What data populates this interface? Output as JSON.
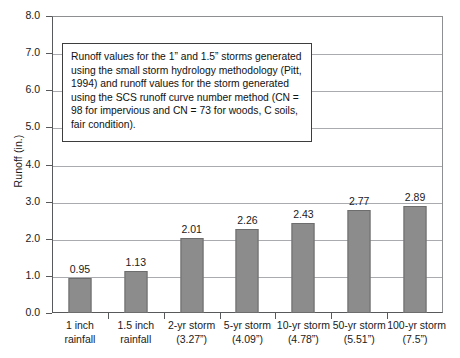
{
  "chart_data": {
    "type": "bar",
    "title": "",
    "xlabel": "",
    "ylabel": "Runoff (in.)",
    "ylim": [
      0.0,
      8.0
    ],
    "y_ticks": [
      "0.0",
      "1.0",
      "2.0",
      "3.0",
      "4.0",
      "5.0",
      "6.0",
      "7.0",
      "8.0"
    ],
    "grid": true,
    "legend": "none",
    "categories": [
      "1 inch rainfall",
      "1.5 inch rainfall",
      "2-yr storm (3.27”)",
      "5-yr storm (4.09”)",
      "10-yr storm (4.78”)",
      "50-yr storm (5.51”)",
      "100-yr storm (7.5”)"
    ],
    "values": [
      0.95,
      1.13,
      2.01,
      2.26,
      2.43,
      2.77,
      2.89
    ],
    "value_labels": [
      "0.95",
      "1.13",
      "2.01",
      "2.26",
      "2.43",
      "2.77",
      "2.89"
    ],
    "category_lines": [
      {
        "l1": "1 inch",
        "l2": "rainfall"
      },
      {
        "l1": "1.5 inch",
        "l2": "rainfall"
      },
      {
        "l1": "2-yr storm",
        "l2": "(3.27”)"
      },
      {
        "l1": "5-yr storm",
        "l2": "(4.09”)"
      },
      {
        "l1": "10-yr storm",
        "l2": "(4.78”)"
      },
      {
        "l1": "50-yr storm",
        "l2": "(5.51”)"
      },
      {
        "l1": "100-yr storm",
        "l2": "(7.5”)"
      }
    ],
    "annotation": "Runoff values for the 1” and 1.5” storms generated using the small storm hydrology methodology (Pitt, 1994) and runoff values for the storm generated using the SCS runoff curve number method (CN = 98 for impervious and CN = 73 for woods, C soils, fair condition).",
    "colors": {
      "bar_fill": "#8c8c8c",
      "bar_stroke": "#6d6d6d",
      "gridline": "#a9abae",
      "axis": "#58595b",
      "text": "#1a1a1a",
      "background": "#ffffff",
      "annotation_border": "#3d3d3d"
    }
  }
}
